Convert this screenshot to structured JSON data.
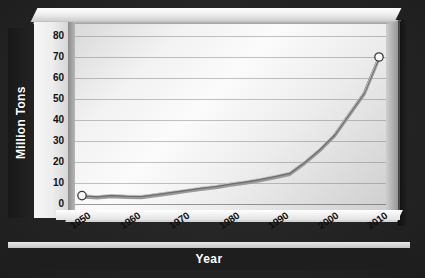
{
  "chart_data": {
    "type": "line",
    "title": "",
    "xlabel": "Year",
    "ylabel": "Million Tons",
    "xlim": [
      1950,
      2010
    ],
    "ylim": [
      0,
      80
    ],
    "grid": true,
    "legend": "none",
    "marker": "open-circle-endpoints",
    "xticks": [
      "1950",
      "1960",
      "1970",
      "1980",
      "1990",
      "2000",
      "2010"
    ],
    "yticks": [
      "80",
      "70",
      "60",
      "50",
      "40",
      "30",
      "20",
      "10",
      "0"
    ],
    "series": [
      {
        "name": "Million Tons",
        "color": "#808080",
        "x": [
          1950,
          1953,
          1956,
          1959,
          1962,
          1965,
          1968,
          1971,
          1974,
          1977,
          1980,
          1983,
          1986,
          1989,
          1992,
          1995,
          1998,
          2001,
          2004,
          2007,
          2010
        ],
        "values": [
          4,
          3.6,
          4.2,
          3.8,
          3.7,
          4.6,
          5.6,
          6.6,
          7.6,
          8.4,
          9.6,
          10.6,
          11.8,
          13.2,
          14.8,
          20,
          26,
          33,
          43,
          53,
          70
        ]
      }
    ]
  },
  "axes": {
    "y_title": "Million Tons",
    "x_title": "Year"
  }
}
